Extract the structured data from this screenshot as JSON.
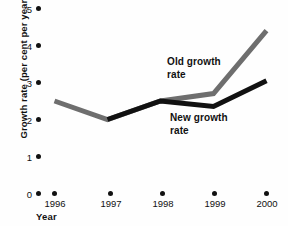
{
  "chart_data": {
    "type": "line",
    "title": "",
    "subtitle": "",
    "xlabel": "Year",
    "ylabel": "Growth rate (per cent per year)",
    "x": [
      "1996",
      "1997",
      "1998",
      "1999",
      "2000"
    ],
    "categories": [
      "1996",
      "1997",
      "1998",
      "1999",
      "2000"
    ],
    "xlim": [
      1996,
      2000
    ],
    "ylim": [
      0,
      5
    ],
    "y_ticks": [
      "0",
      "1",
      "2",
      "3",
      "4",
      "5"
    ],
    "y_tick_values": [
      0,
      1,
      2,
      3,
      4,
      5
    ],
    "x_ticks": [
      "1996",
      "1997",
      "1998",
      "1999",
      "2000"
    ],
    "grid": false,
    "legend_position": "inline-annotation",
    "markers": false,
    "series": [
      {
        "name": "Old growth rate",
        "color": "#6e6e6e",
        "x": [
          "1996",
          "1997",
          "1998",
          "1999",
          "2000"
        ],
        "values": [
          2.5,
          2.0,
          2.5,
          2.7,
          4.4
        ]
      },
      {
        "name": "New growth rate",
        "color": "#111111",
        "x": [
          "1997",
          "1998",
          "1999",
          "2000"
        ],
        "values": [
          2.0,
          2.5,
          2.35,
          3.05
        ]
      }
    ],
    "annotations": [
      {
        "text": "Old growth rate",
        "series": "Old growth rate"
      },
      {
        "text": "New growth rate",
        "series": "New growth rate"
      }
    ]
  },
  "axes": {
    "y_title": "Growth rate (per cent per year)",
    "x_title": "Year",
    "y_tick_labels": [
      "0",
      "1",
      "2",
      "3",
      "4",
      "5"
    ],
    "x_tick_labels": [
      "1996",
      "1997",
      "1998",
      "1999",
      "2000"
    ]
  },
  "labels": {
    "old_growth": "Old growth\nrate",
    "old_growth_line1": "Old growth",
    "old_growth_line2": "rate",
    "new_growth_line1": "New growth",
    "new_growth_line2": "rate"
  },
  "colors": {
    "old_series": "#6e6e6e",
    "new_series": "#111111",
    "text": "#111111",
    "background": "#fefefe"
  }
}
